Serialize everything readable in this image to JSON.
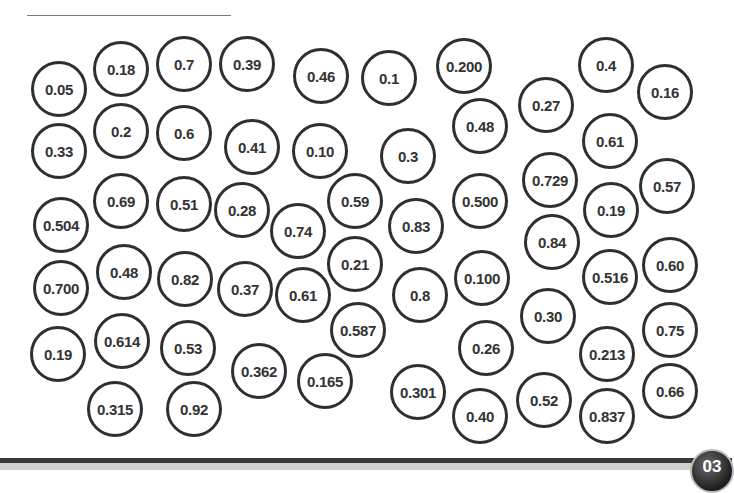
{
  "worksheet": {
    "name_line": "",
    "page_number": "03",
    "bubbles": [
      {
        "value": "0.05",
        "x": 31,
        "y": 61,
        "d": 56
      },
      {
        "value": "0.18",
        "x": 93,
        "y": 41,
        "d": 56
      },
      {
        "value": "0.7",
        "x": 156,
        "y": 36,
        "d": 56
      },
      {
        "value": "0.39",
        "x": 219,
        "y": 36,
        "d": 56
      },
      {
        "value": "0.46",
        "x": 293,
        "y": 48,
        "d": 56
      },
      {
        "value": "0.1",
        "x": 361,
        "y": 50,
        "d": 56
      },
      {
        "value": "0.200",
        "x": 436,
        "y": 38,
        "d": 56
      },
      {
        "value": "0.4",
        "x": 578,
        "y": 37,
        "d": 56
      },
      {
        "value": "0.16",
        "x": 637,
        "y": 64,
        "d": 56
      },
      {
        "value": "0.27",
        "x": 518,
        "y": 77,
        "d": 56
      },
      {
        "value": "0.48",
        "x": 452,
        "y": 98,
        "d": 56
      },
      {
        "value": "0.33",
        "x": 31,
        "y": 123,
        "d": 56
      },
      {
        "value": "0.2",
        "x": 93,
        "y": 103,
        "d": 56
      },
      {
        "value": "0.6",
        "x": 156,
        "y": 105,
        "d": 56
      },
      {
        "value": "0.41",
        "x": 224,
        "y": 119,
        "d": 56
      },
      {
        "value": "0.10",
        "x": 292,
        "y": 123,
        "d": 56
      },
      {
        "value": "0.3",
        "x": 380,
        "y": 128,
        "d": 56
      },
      {
        "value": "0.61",
        "x": 582,
        "y": 113,
        "d": 56
      },
      {
        "value": "0.729",
        "x": 522,
        "y": 152,
        "d": 56
      },
      {
        "value": "0.57",
        "x": 639,
        "y": 158,
        "d": 56
      },
      {
        "value": "0.19",
        "x": 583,
        "y": 182,
        "d": 56
      },
      {
        "value": "0.500",
        "x": 452,
        "y": 173,
        "d": 56
      },
      {
        "value": "0.504",
        "x": 33,
        "y": 197,
        "d": 56
      },
      {
        "value": "0.69",
        "x": 93,
        "y": 173,
        "d": 56
      },
      {
        "value": "0.51",
        "x": 156,
        "y": 176,
        "d": 56
      },
      {
        "value": "0.28",
        "x": 214,
        "y": 182,
        "d": 56
      },
      {
        "value": "0.74",
        "x": 270,
        "y": 203,
        "d": 56
      },
      {
        "value": "0.59",
        "x": 327,
        "y": 173,
        "d": 56
      },
      {
        "value": "0.83",
        "x": 388,
        "y": 198,
        "d": 56
      },
      {
        "value": "0.84",
        "x": 524,
        "y": 214,
        "d": 56
      },
      {
        "value": "0.21",
        "x": 327,
        "y": 236,
        "d": 56
      },
      {
        "value": "0.700",
        "x": 33,
        "y": 260,
        "d": 56
      },
      {
        "value": "0.48",
        "x": 96,
        "y": 244,
        "d": 56
      },
      {
        "value": "0.82",
        "x": 157,
        "y": 251,
        "d": 56
      },
      {
        "value": "0.37",
        "x": 217,
        "y": 261,
        "d": 56
      },
      {
        "value": "0.61",
        "x": 275,
        "y": 267,
        "d": 56
      },
      {
        "value": "0.8",
        "x": 392,
        "y": 267,
        "d": 56
      },
      {
        "value": "0.100",
        "x": 454,
        "y": 250,
        "d": 56
      },
      {
        "value": "0.516",
        "x": 582,
        "y": 249,
        "d": 56
      },
      {
        "value": "0.60",
        "x": 642,
        "y": 237,
        "d": 56
      },
      {
        "value": "0.30",
        "x": 520,
        "y": 288,
        "d": 56
      },
      {
        "value": "0.75",
        "x": 642,
        "y": 302,
        "d": 56
      },
      {
        "value": "0.587",
        "x": 330,
        "y": 302,
        "d": 56
      },
      {
        "value": "0.19",
        "x": 30,
        "y": 326,
        "d": 56
      },
      {
        "value": "0.614",
        "x": 94,
        "y": 313,
        "d": 56
      },
      {
        "value": "0.53",
        "x": 160,
        "y": 320,
        "d": 56
      },
      {
        "value": "0.26",
        "x": 458,
        "y": 320,
        "d": 56
      },
      {
        "value": "0.213",
        "x": 579,
        "y": 326,
        "d": 56
      },
      {
        "value": "0.362",
        "x": 231,
        "y": 343,
        "d": 56
      },
      {
        "value": "0.165",
        "x": 297,
        "y": 353,
        "d": 56
      },
      {
        "value": "0.301",
        "x": 390,
        "y": 364,
        "d": 56
      },
      {
        "value": "0.66",
        "x": 642,
        "y": 363,
        "d": 56
      },
      {
        "value": "0.52",
        "x": 516,
        "y": 372,
        "d": 56
      },
      {
        "value": "0.315",
        "x": 87,
        "y": 381,
        "d": 56
      },
      {
        "value": "0.92",
        "x": 166,
        "y": 381,
        "d": 56
      },
      {
        "value": "0.40",
        "x": 452,
        "y": 388,
        "d": 56
      },
      {
        "value": "0.837",
        "x": 579,
        "y": 388,
        "d": 56
      }
    ]
  }
}
